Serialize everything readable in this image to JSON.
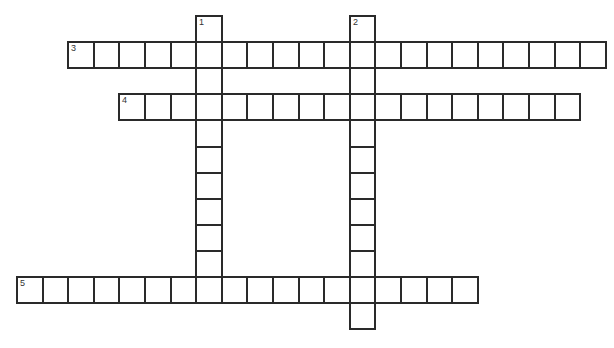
{
  "puzzle": {
    "type": "crossword",
    "grid": {
      "origin_x": 16,
      "origin_y": 15,
      "cell_w": 25.6,
      "cell_h": 26.1,
      "border_color": "#2a2a2a",
      "background": "#ffffff"
    },
    "entries": [
      {
        "number": "1",
        "direction": "down",
        "col": 7,
        "row": 0,
        "length": 11
      },
      {
        "number": "2",
        "direction": "down",
        "col": 13,
        "row": 0,
        "length": 12
      },
      {
        "number": "3",
        "direction": "across",
        "col": 2,
        "row": 1,
        "length": 21
      },
      {
        "number": "4",
        "direction": "across",
        "col": 4,
        "row": 3,
        "length": 18
      },
      {
        "number": "5",
        "direction": "across",
        "col": 0,
        "row": 10,
        "length": 18
      }
    ]
  }
}
